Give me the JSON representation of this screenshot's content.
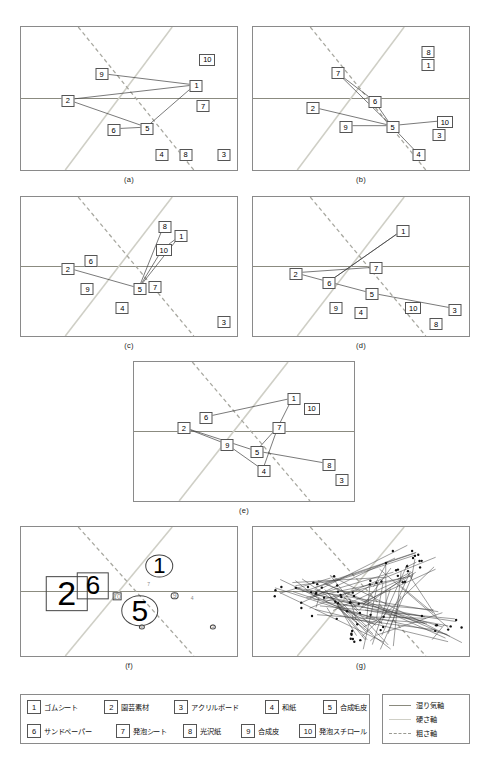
{
  "figure": {
    "panels": [
      {
        "id": "a",
        "caption": "(a)",
        "x": 20,
        "y": 26,
        "w": 218,
        "h": 145
      },
      {
        "id": "b",
        "caption": "(b)",
        "x": 252,
        "y": 26,
        "w": 218,
        "h": 145
      },
      {
        "id": "c",
        "caption": "(c)",
        "x": 20,
        "y": 196,
        "w": 218,
        "h": 141
      },
      {
        "id": "d",
        "caption": "(d)",
        "x": 252,
        "y": 196,
        "w": 218,
        "h": 141
      },
      {
        "id": "e",
        "caption": "(e)",
        "x": 133,
        "y": 361,
        "w": 222,
        "h": 141
      },
      {
        "id": "f",
        "caption": "(f)",
        "x": 20,
        "y": 526,
        "w": 218,
        "h": 131
      },
      {
        "id": "g",
        "caption": "(g)",
        "x": 252,
        "y": 526,
        "w": 218,
        "h": 131
      }
    ]
  },
  "axes": {
    "moisture": {
      "label": "湿り気軸",
      "color": "#8a8a7e",
      "style": "solid"
    },
    "hardness": {
      "label": "硬さ軸",
      "color": "#c8c8c0",
      "style": "solid-light"
    },
    "roughness": {
      "label": "粗さ軸",
      "color": "#9a9a92",
      "style": "dashed"
    }
  },
  "materials": [
    {
      "num": "1",
      "name": "ゴムシート"
    },
    {
      "num": "2",
      "name": "園芸素材"
    },
    {
      "num": "3",
      "name": "アクリルボード"
    },
    {
      "num": "4",
      "name": "和紙"
    },
    {
      "num": "5",
      "name": "合成毛皮"
    },
    {
      "num": "6",
      "name": "サンドペーパー"
    },
    {
      "num": "7",
      "name": "発泡シート"
    },
    {
      "num": "8",
      "name": "光沢紙"
    },
    {
      "num": "9",
      "name": "合成皮"
    },
    {
      "num": "10",
      "name": "発泡スチロール"
    }
  ],
  "chart_data": {
    "type": "scatter",
    "title": "",
    "xlabel": "",
    "ylabel": "",
    "xlim": [
      0,
      1
    ],
    "ylim": [
      0,
      1
    ],
    "grid": false,
    "legend_position": "bottom",
    "note": "Seven scatter panels of 10 tactile materials plotted on three perceptual axes (moisture / hardness / roughness). Coordinates are normalized 0-1 fractions of each panel box; edges list connected node pairs.",
    "panels": [
      {
        "id": "a",
        "points": [
          {
            "num": "1",
            "x": 0.805,
            "y": 0.405
          },
          {
            "num": "2",
            "x": 0.215,
            "y": 0.508
          },
          {
            "num": "5",
            "x": 0.58,
            "y": 0.7
          },
          {
            "num": "6",
            "x": 0.425,
            "y": 0.712
          },
          {
            "num": "9",
            "x": 0.37,
            "y": 0.325
          },
          {
            "num": "10",
            "x": 0.855,
            "y": 0.225
          },
          {
            "num": "7",
            "x": 0.835,
            "y": 0.545
          },
          {
            "num": "4",
            "x": 0.645,
            "y": 0.88
          },
          {
            "num": "8",
            "x": 0.755,
            "y": 0.88
          },
          {
            "num": "3",
            "x": 0.93,
            "y": 0.88
          }
        ],
        "edges": [
          [
            "9",
            "1"
          ],
          [
            "2",
            "1"
          ],
          [
            "2",
            "5"
          ],
          [
            "6",
            "5"
          ],
          [
            "5",
            "1"
          ]
        ]
      },
      {
        "id": "b",
        "points": [
          {
            "num": "7",
            "x": 0.39,
            "y": 0.32
          },
          {
            "num": "6",
            "x": 0.56,
            "y": 0.515
          },
          {
            "num": "2",
            "x": 0.275,
            "y": 0.56
          },
          {
            "num": "5",
            "x": 0.64,
            "y": 0.69
          },
          {
            "num": "9",
            "x": 0.425,
            "y": 0.69
          },
          {
            "num": "10",
            "x": 0.88,
            "y": 0.655
          },
          {
            "num": "4",
            "x": 0.76,
            "y": 0.88
          },
          {
            "num": "8",
            "x": 0.805,
            "y": 0.175
          },
          {
            "num": "1",
            "x": 0.805,
            "y": 0.265
          },
          {
            "num": "3",
            "x": 0.855,
            "y": 0.745
          }
        ],
        "edges": [
          [
            "7",
            "6"
          ],
          [
            "7",
            "5"
          ],
          [
            "6",
            "5"
          ],
          [
            "2",
            "5"
          ],
          [
            "9",
            "5"
          ],
          [
            "5",
            "10"
          ],
          [
            "5",
            "4"
          ]
        ]
      },
      {
        "id": "c",
        "points": [
          {
            "num": "8",
            "x": 0.66,
            "y": 0.21
          },
          {
            "num": "1",
            "x": 0.735,
            "y": 0.28
          },
          {
            "num": "10",
            "x": 0.655,
            "y": 0.375
          },
          {
            "num": "2",
            "x": 0.215,
            "y": 0.51
          },
          {
            "num": "6",
            "x": 0.32,
            "y": 0.455
          },
          {
            "num": "5",
            "x": 0.545,
            "y": 0.655
          },
          {
            "num": "7",
            "x": 0.615,
            "y": 0.64
          },
          {
            "num": "9",
            "x": 0.305,
            "y": 0.655
          },
          {
            "num": "4",
            "x": 0.465,
            "y": 0.79
          },
          {
            "num": "3",
            "x": 0.93,
            "y": 0.89
          }
        ],
        "edges": [
          [
            "8",
            "5"
          ],
          [
            "1",
            "5"
          ],
          [
            "10",
            "5"
          ],
          [
            "2",
            "5"
          ],
          [
            "1",
            "10"
          ]
        ]
      },
      {
        "id": "d",
        "points": [
          {
            "num": "1",
            "x": 0.69,
            "y": 0.24
          },
          {
            "num": "7",
            "x": 0.565,
            "y": 0.505
          },
          {
            "num": "2",
            "x": 0.195,
            "y": 0.545
          },
          {
            "num": "6",
            "x": 0.35,
            "y": 0.61
          },
          {
            "num": "5",
            "x": 0.545,
            "y": 0.69
          },
          {
            "num": "10",
            "x": 0.735,
            "y": 0.79
          },
          {
            "num": "3",
            "x": 0.925,
            "y": 0.8
          },
          {
            "num": "9",
            "x": 0.38,
            "y": 0.79
          },
          {
            "num": "4",
            "x": 0.495,
            "y": 0.82
          },
          {
            "num": "8",
            "x": 0.84,
            "y": 0.9
          }
        ],
        "edges": [
          [
            "2",
            "7"
          ],
          [
            "2",
            "6"
          ],
          [
            "6",
            "5"
          ],
          [
            "6",
            "1"
          ],
          [
            "5",
            "3"
          ],
          [
            "1",
            "6"
          ]
        ]
      },
      {
        "id": "e",
        "points": [
          {
            "num": "1",
            "x": 0.72,
            "y": 0.26
          },
          {
            "num": "10",
            "x": 0.8,
            "y": 0.33
          },
          {
            "num": "6",
            "x": 0.325,
            "y": 0.395
          },
          {
            "num": "2",
            "x": 0.225,
            "y": 0.47
          },
          {
            "num": "7",
            "x": 0.655,
            "y": 0.465
          },
          {
            "num": "9",
            "x": 0.42,
            "y": 0.59
          },
          {
            "num": "5",
            "x": 0.555,
            "y": 0.64
          },
          {
            "num": "4",
            "x": 0.585,
            "y": 0.775
          },
          {
            "num": "8",
            "x": 0.88,
            "y": 0.73
          },
          {
            "num": "3",
            "x": 0.935,
            "y": 0.84
          }
        ],
        "edges": [
          [
            "6",
            "1"
          ],
          [
            "2",
            "5"
          ],
          [
            "2",
            "9"
          ],
          [
            "9",
            "4"
          ],
          [
            "5",
            "7"
          ],
          [
            "7",
            "4"
          ],
          [
            "1",
            "7"
          ],
          [
            "5",
            "8"
          ]
        ]
      },
      {
        "id": "f",
        "note": "Frequency-weighted label sizes; 2,6,5,1 dominant",
        "points": [
          {
            "num": "2",
            "x": 0.21,
            "y": 0.51,
            "size": 34,
            "shape": "square"
          },
          {
            "num": "6",
            "x": 0.33,
            "y": 0.45,
            "size": 26,
            "shape": "square"
          },
          {
            "num": "5",
            "x": 0.545,
            "y": 0.64,
            "size": 30,
            "shape": "circle"
          },
          {
            "num": "1",
            "x": 0.635,
            "y": 0.3,
            "size": 22,
            "shape": "circle"
          },
          {
            "num": "10",
            "x": 0.44,
            "y": 0.53,
            "size": 7,
            "shape": "square"
          },
          {
            "num": "9",
            "x": 0.705,
            "y": 0.525,
            "size": 7,
            "shape": "circle"
          },
          {
            "num": "7",
            "x": 0.585,
            "y": 0.44,
            "size": 5,
            "shape": "none"
          },
          {
            "num": "4",
            "x": 0.785,
            "y": 0.545,
            "size": 5,
            "shape": "none"
          },
          {
            "num": "8",
            "x": 0.555,
            "y": 0.76,
            "size": 5,
            "shape": "circle"
          },
          {
            "num": "3",
            "x": 0.88,
            "y": 0.76,
            "size": 5,
            "shape": "circle"
          }
        ],
        "edges": []
      },
      {
        "id": "g",
        "note": "All participants' response networks overlaid",
        "points": [],
        "edges": []
      }
    ]
  }
}
